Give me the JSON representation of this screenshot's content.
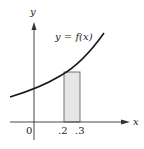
{
  "diagram": {
    "curve_label": "y = f(x)",
    "x_axis_label": "x",
    "y_axis_label": "y",
    "origin_label": "0",
    "ticks": [
      ".2",
      ".3"
    ],
    "colors": {
      "curve": "#1a1a1a",
      "axis": "#333333",
      "rect_fill": "#e6e6e6",
      "rect_stroke": "#555555"
    }
  }
}
